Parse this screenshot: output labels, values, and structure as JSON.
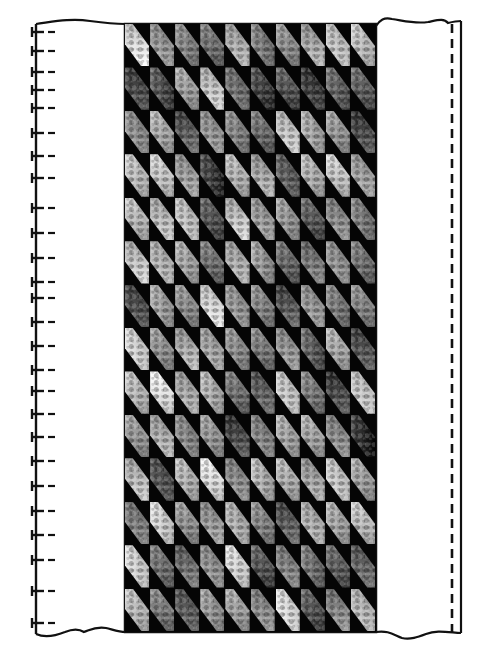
{
  "diagram": {
    "type": "quilt-strip-layout",
    "grid": {
      "columns": 10,
      "rows": 14,
      "background_color": "#050505",
      "tile_shape": "diagonal-hexagon",
      "tones": [
        [
          225,
          150,
          130,
          110,
          175,
          120,
          140,
          170,
          195,
          190
        ],
        [
          70,
          75,
          160,
          200,
          110,
          60,
          80,
          55,
          95,
          90
        ],
        [
          140,
          170,
          90,
          150,
          130,
          105,
          200,
          165,
          150,
          70
        ],
        [
          190,
          200,
          160,
          55,
          180,
          170,
          90,
          175,
          200,
          160
        ],
        [
          185,
          190,
          195,
          80,
          200,
          155,
          150,
          85,
          140,
          120
        ],
        [
          200,
          180,
          165,
          110,
          175,
          150,
          100,
          120,
          145,
          110
        ],
        [
          75,
          160,
          140,
          220,
          150,
          130,
          85,
          150,
          120,
          130
        ],
        [
          210,
          145,
          175,
          165,
          140,
          120,
          150,
          90,
          170,
          80
        ],
        [
          185,
          230,
          170,
          175,
          110,
          95,
          200,
          120,
          70,
          200
        ],
        [
          150,
          175,
          135,
          150,
          70,
          130,
          165,
          165,
          140,
          40
        ],
        [
          190,
          80,
          180,
          225,
          140,
          175,
          175,
          165,
          200,
          160
        ],
        [
          125,
          210,
          145,
          155,
          175,
          130,
          90,
          175,
          165,
          190
        ],
        [
          210,
          110,
          110,
          145,
          215,
          80,
          130,
          110,
          90,
          100
        ],
        [
          185,
          120,
          90,
          150,
          160,
          140,
          220,
          80,
          135,
          185
        ]
      ]
    },
    "left_edge": {
      "style": "binding-ticks",
      "tick_y": [
        32,
        51,
        72,
        90,
        108,
        133,
        156,
        178,
        208,
        233,
        258,
        282,
        298,
        322,
        346,
        370,
        391,
        414,
        437,
        461,
        486,
        511,
        535,
        560,
        591,
        623
      ]
    },
    "right_edge": {
      "style": "dashed-seam-line",
      "dash_x": 453,
      "border_x": 461
    },
    "outline_color": "#111111"
  }
}
